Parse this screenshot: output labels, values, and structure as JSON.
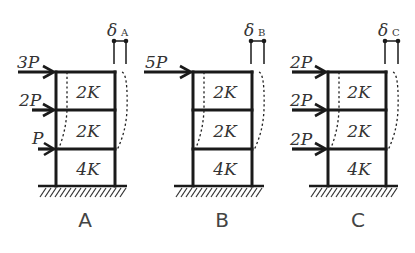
{
  "diagram": {
    "type": "structural-frame-comparison",
    "colors": {
      "line": "#1a1a1a",
      "text": "#333333",
      "background": "#ffffff"
    },
    "frames": [
      {
        "id": "A",
        "name": "A",
        "delta_symbol": "δ",
        "delta_subscript": "A",
        "stories": [
          {
            "level": 3,
            "stiffness": "2K"
          },
          {
            "level": 2,
            "stiffness": "2K"
          },
          {
            "level": 1,
            "stiffness": "4K"
          }
        ],
        "loads": [
          {
            "level": 3,
            "label": "3P"
          },
          {
            "level": 2,
            "label": "2P"
          },
          {
            "level": 1,
            "label": "P"
          }
        ]
      },
      {
        "id": "B",
        "name": "B",
        "delta_symbol": "δ",
        "delta_subscript": "B",
        "stories": [
          {
            "level": 3,
            "stiffness": "2K"
          },
          {
            "level": 2,
            "stiffness": "2K"
          },
          {
            "level": 1,
            "stiffness": "4K"
          }
        ],
        "loads": [
          {
            "level": 3,
            "label": "5P"
          }
        ]
      },
      {
        "id": "C",
        "name": "C",
        "delta_symbol": "δ",
        "delta_subscript": "C",
        "stories": [
          {
            "level": 3,
            "stiffness": "2K"
          },
          {
            "level": 2,
            "stiffness": "2K"
          },
          {
            "level": 1,
            "stiffness": "4K"
          }
        ],
        "loads": [
          {
            "level": 3,
            "label": "2P"
          },
          {
            "level": 2,
            "label": "2P"
          },
          {
            "level": 1,
            "label": "2P"
          }
        ]
      }
    ]
  }
}
